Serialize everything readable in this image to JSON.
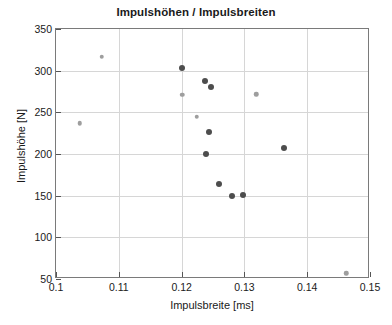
{
  "chart_data": {
    "type": "scatter",
    "title": "Impulshöhen / Impulsbreiten",
    "xlabel": "Impulsbreite [ms]",
    "ylabel": "Impulshöhe [N]",
    "xlim": [
      0.1,
      0.15
    ],
    "ylim": [
      50,
      350
    ],
    "xticks": [
      "0.1",
      "0.11",
      "0.12",
      "0.13",
      "0.14",
      "0.15"
    ],
    "xtick_values": [
      0.1,
      0.11,
      0.12,
      0.13,
      0.14,
      0.15
    ],
    "yticks": [
      "50",
      "100",
      "150",
      "200",
      "250",
      "300",
      "350"
    ],
    "ytick_values": [
      50,
      100,
      150,
      200,
      250,
      300,
      350
    ],
    "grid": true,
    "legend": "none",
    "series": [
      {
        "name": "dark-markers",
        "color": "#4d4d4d",
        "marker_size": 6,
        "points": [
          {
            "x": 0.1201,
            "y": 303
          },
          {
            "x": 0.1237,
            "y": 288
          },
          {
            "x": 0.1247,
            "y": 280
          },
          {
            "x": 0.1243,
            "y": 226
          },
          {
            "x": 0.1239,
            "y": 200
          },
          {
            "x": 0.126,
            "y": 164
          },
          {
            "x": 0.128,
            "y": 150
          },
          {
            "x": 0.1298,
            "y": 151
          },
          {
            "x": 0.1363,
            "y": 207
          }
        ]
      },
      {
        "name": "light-markers",
        "color": "#9e9e9e",
        "marker_size": 4.5,
        "points": [
          {
            "x": 0.1038,
            "y": 237
          },
          {
            "x": 0.1073,
            "y": 317
          },
          {
            "x": 0.1201,
            "y": 271
          },
          {
            "x": 0.1224,
            "y": 245
          },
          {
            "x": 0.1319,
            "y": 272
          },
          {
            "x": 0.1462,
            "y": 57
          }
        ]
      }
    ]
  }
}
